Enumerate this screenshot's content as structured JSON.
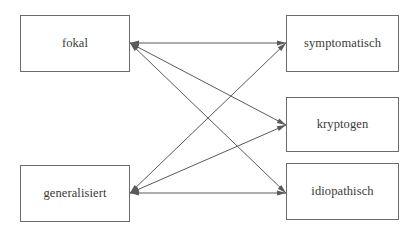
{
  "diagram": {
    "type": "bipartite-relationship-diagram",
    "canvas": {
      "width": 419,
      "height": 233
    },
    "colors": {
      "background": "#ffffff",
      "box_border": "#6b6b6b",
      "edge_line": "#5a5a5a",
      "text": "#3a3a3a"
    },
    "nodes": [
      {
        "id": "fokal",
        "label": "fokal",
        "side": "left",
        "x": 20,
        "y": 15,
        "width": 110,
        "height": 57,
        "anchor_x": 130,
        "anchor_y": 43
      },
      {
        "id": "generalisiert",
        "label": "generalisiert",
        "side": "left",
        "x": 20,
        "y": 165,
        "width": 110,
        "height": 57,
        "anchor_x": 130,
        "anchor_y": 193
      },
      {
        "id": "symptomatisch",
        "label": "symptomatisch",
        "side": "right",
        "x": 286,
        "y": 15,
        "width": 113,
        "height": 57,
        "anchor_x": 286,
        "anchor_y": 43
      },
      {
        "id": "kryptogen",
        "label": "kryptogen",
        "side": "right",
        "x": 286,
        "y": 97,
        "width": 113,
        "height": 55,
        "anchor_x": 286,
        "anchor_y": 125
      },
      {
        "id": "idiopathisch",
        "label": "idiopathisch",
        "side": "right",
        "x": 286,
        "y": 163,
        "width": 113,
        "height": 57,
        "anchor_x": 286,
        "anchor_y": 193
      }
    ],
    "edges": [
      {
        "id": "fokal-symptomatisch",
        "from": "fokal",
        "to": "symptomatisch",
        "x1": 130,
        "y1": 43,
        "x2": 286,
        "y2": 43,
        "arrows": "both"
      },
      {
        "id": "fokal-kryptogen",
        "from": "fokal",
        "to": "kryptogen",
        "x1": 130,
        "y1": 43,
        "x2": 286,
        "y2": 125,
        "arrows": "both"
      },
      {
        "id": "fokal-idiopathisch",
        "from": "fokal",
        "to": "idiopathisch",
        "x1": 130,
        "y1": 43,
        "x2": 286,
        "y2": 193,
        "arrows": "both"
      },
      {
        "id": "generalisiert-symptomatisch",
        "from": "generalisiert",
        "to": "symptomatisch",
        "x1": 130,
        "y1": 193,
        "x2": 286,
        "y2": 43,
        "arrows": "both"
      },
      {
        "id": "generalisiert-kryptogen",
        "from": "generalisiert",
        "to": "kryptogen",
        "x1": 130,
        "y1": 193,
        "x2": 286,
        "y2": 125,
        "arrows": "both"
      },
      {
        "id": "generalisiert-idiopathisch",
        "from": "generalisiert",
        "to": "idiopathisch",
        "x1": 130,
        "y1": 193,
        "x2": 286,
        "y2": 193,
        "arrows": "both"
      }
    ]
  }
}
